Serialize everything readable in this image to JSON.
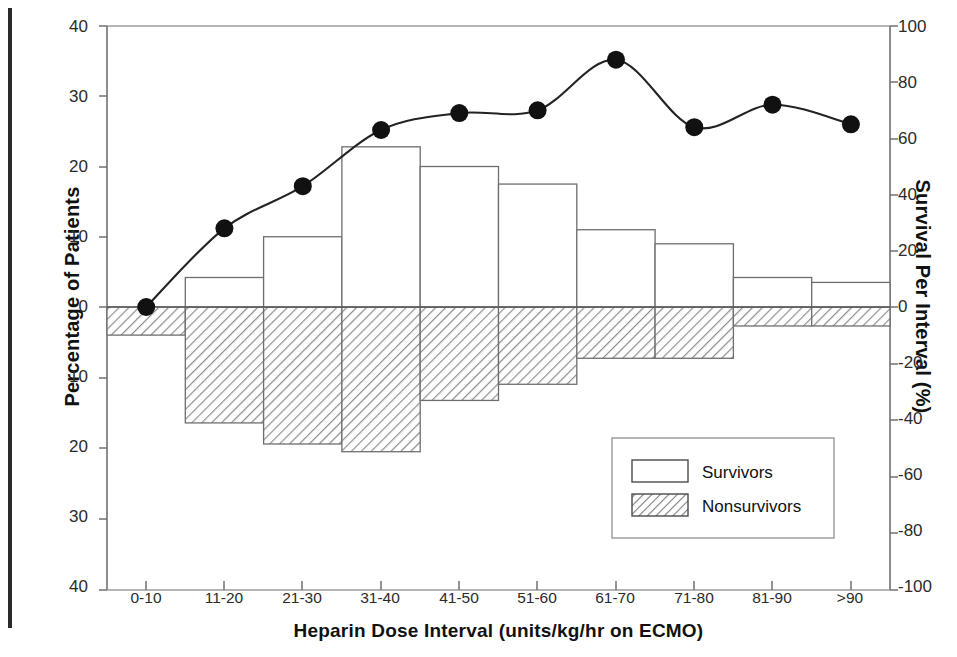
{
  "chart_data": {
    "type": "bar",
    "title": "",
    "xlabel": "Heparin Dose Interval (units/kg/hr on ECMO)",
    "ylabel": "Percentage of Patients",
    "ylabel_right": "Survival Per Interval (%)",
    "categories": [
      "0-10",
      "11-20",
      "21-30",
      "31-40",
      "41-50",
      "51-60",
      "61-70",
      "71-80",
      "81-90",
      ">90"
    ],
    "ylim": [
      -40,
      40
    ],
    "ylim_right": [
      -100,
      100
    ],
    "yticks": [
      "40",
      "30",
      "20",
      "10",
      "0",
      "10",
      "20",
      "30",
      "40"
    ],
    "yticks_right": [
      "100",
      "80",
      "60",
      "40",
      "20",
      "0",
      "-20",
      "-40",
      "-60",
      "-80",
      "-100"
    ],
    "grid": false,
    "legend_position": "lower right",
    "series": [
      {
        "name": "Survivors",
        "type": "bar",
        "axis": "left",
        "fill": "none",
        "values": [
          0,
          4.2,
          10.0,
          22.8,
          20.0,
          17.5,
          11.0,
          9.0,
          4.2,
          3.5
        ]
      },
      {
        "name": "Nonsurvivors",
        "type": "bar",
        "axis": "left",
        "fill": "hatch",
        "values": [
          -4.0,
          -16.5,
          -19.5,
          -20.6,
          -13.3,
          -11.0,
          -7.3,
          -7.3,
          -2.7,
          -2.7
        ]
      },
      {
        "name": "Survival Per Interval",
        "type": "line",
        "axis": "right",
        "marker": "filled-circle",
        "values": [
          0,
          28,
          43,
          63,
          69,
          70,
          88,
          64,
          72,
          65
        ]
      }
    ],
    "colors": {
      "axis": "#555555",
      "line": "#222222",
      "marker": "#111111",
      "bar_edge": "#666666",
      "hatch": "#8a8a8a",
      "text": "#1a1a1a"
    }
  },
  "legend": {
    "entries": [
      {
        "label": "Survivors",
        "swatch": "empty"
      },
      {
        "label": "Nonsurvivors",
        "swatch": "hatched"
      }
    ]
  }
}
